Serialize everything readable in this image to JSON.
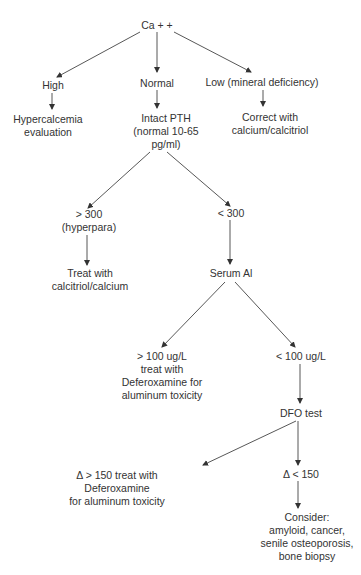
{
  "diagram": {
    "type": "flowchart",
    "nodes": {
      "root": {
        "lines": [
          "Ca + +"
        ]
      },
      "high": {
        "lines": [
          "High"
        ]
      },
      "normal": {
        "lines": [
          "Normal"
        ]
      },
      "low": {
        "lines": [
          "Low (mineral deficiency)"
        ]
      },
      "hypercalcemia": {
        "lines": [
          "Hypercalcemia",
          "evaluation"
        ]
      },
      "intact_pth": {
        "lines": [
          "Intact PTH",
          "(normal 10-65",
          "pg/ml)"
        ]
      },
      "correct": {
        "lines": [
          "Correct with",
          "calcium/calcitriol"
        ]
      },
      "gt300": {
        "lines": [
          "> 300",
          "(hyperpara)"
        ]
      },
      "lt300": {
        "lines": [
          "< 300"
        ]
      },
      "treat_calcitriol": {
        "lines": [
          "Treat with",
          "calcitriol/calcium"
        ]
      },
      "serum_al": {
        "lines": [
          "Serum Al"
        ]
      },
      "gt100": {
        "lines": [
          "> 100 ug/L",
          "treat with",
          "Deferoxamine for",
          "aluminum toxicity"
        ]
      },
      "lt100": {
        "lines": [
          "< 100 ug/L"
        ]
      },
      "dfo_test": {
        "lines": [
          "DFO test"
        ]
      },
      "delta_gt150": {
        "lines": [
          "Δ > 150 treat with",
          "Deferoxamine",
          "for aluminum toxicity"
        ]
      },
      "delta_lt150": {
        "lines": [
          "Δ < 150"
        ]
      },
      "consider": {
        "lines": [
          "Consider:",
          "amyloid, cancer,",
          "senile osteoporosis,",
          "bone biopsy"
        ]
      }
    },
    "edges": [
      [
        "root",
        "high"
      ],
      [
        "root",
        "normal"
      ],
      [
        "root",
        "low"
      ],
      [
        "high",
        "hypercalcemia"
      ],
      [
        "normal",
        "intact_pth"
      ],
      [
        "low",
        "correct"
      ],
      [
        "intact_pth",
        "gt300"
      ],
      [
        "intact_pth",
        "lt300"
      ],
      [
        "gt300",
        "treat_calcitriol"
      ],
      [
        "lt300",
        "serum_al"
      ],
      [
        "serum_al",
        "gt100"
      ],
      [
        "serum_al",
        "lt100"
      ],
      [
        "lt100",
        "dfo_test"
      ],
      [
        "dfo_test",
        "delta_gt150"
      ],
      [
        "dfo_test",
        "delta_lt150"
      ],
      [
        "delta_lt150",
        "consider"
      ]
    ],
    "colors": {
      "line": "#333333",
      "text": "#333333",
      "background": "#ffffff"
    }
  }
}
